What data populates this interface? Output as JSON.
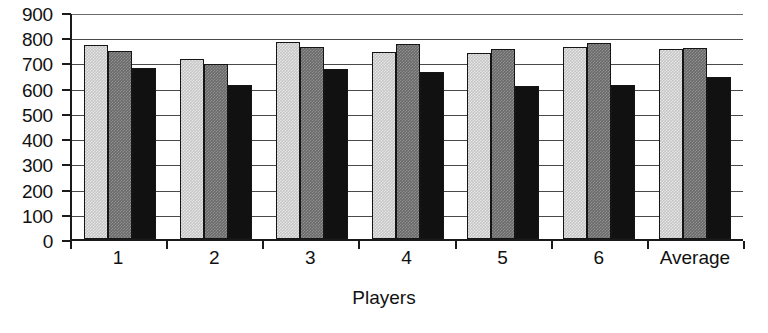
{
  "chart_data": {
    "type": "bar",
    "title": "",
    "subtitle": "",
    "xlabel": "Players",
    "ylabel": "",
    "categories": [
      "1",
      "2",
      "3",
      "4",
      "5",
      "6",
      "Average"
    ],
    "series": [
      {
        "name": "series-1-light-gray",
        "color": "#c6c6c6",
        "values": [
          770,
          712,
          780,
          740,
          738,
          762,
          755
        ]
      },
      {
        "name": "series-2-dark-gray",
        "color": "#6a6a6a",
        "values": [
          745,
          695,
          762,
          775,
          755,
          778,
          758
        ]
      },
      {
        "name": "series-3-black",
        "color": "#111111",
        "values": [
          680,
          612,
          675,
          662,
          608,
          612,
          643
        ]
      }
    ],
    "ylim": [
      0,
      900
    ],
    "y_ticks": [
      0,
      100,
      200,
      300,
      400,
      500,
      600,
      700,
      800,
      900
    ],
    "y_tick_labels": [
      "0",
      "100",
      "200",
      "300",
      "400",
      "500",
      "600",
      "700",
      "800",
      "900"
    ],
    "grid": true,
    "grid_axis": "y",
    "legend": false,
    "legend_position": "none",
    "annotations": []
  },
  "axes": {
    "x_title": "Players",
    "y_title": ""
  }
}
